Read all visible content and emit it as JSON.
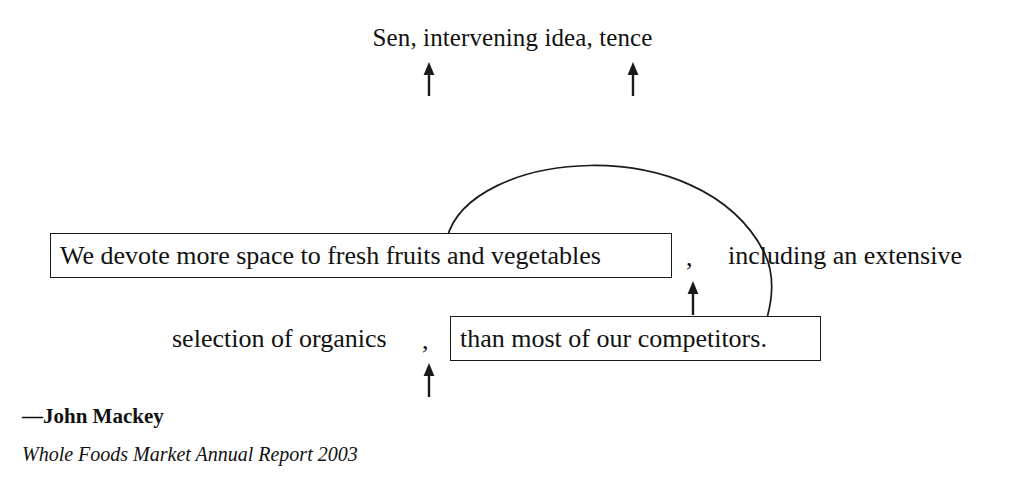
{
  "figure": {
    "background_color": "#ffffff",
    "ink_color": "#1a1a1a"
  },
  "annotation": {
    "top_label": "Sen, intervening idea, tence",
    "pointer_icons": [
      {
        "name": "arrow-up-icon",
        "target": "Sen"
      },
      {
        "name": "arrow-up-icon",
        "target": "tence"
      },
      {
        "name": "arrow-up-icon",
        "target": "comma-after-vegetables"
      },
      {
        "name": "arrow-up-icon",
        "target": "comma-after-organics"
      }
    ],
    "connector": {
      "name": "arc-connector",
      "from": "sentence-box-1",
      "to": "sentence-box-2"
    }
  },
  "quote": {
    "line1": {
      "boxed_segment": "We devote more space to fresh fruits and vegetables",
      "comma": ",",
      "trailing_text": "including an extensive"
    },
    "line2": {
      "leading_text": "selection of organics",
      "comma": ",",
      "boxed_segment": "than most of our competitors."
    }
  },
  "attribution": {
    "name": "—John Mackey",
    "source": "Whole Foods Market Annual Report 2003"
  }
}
